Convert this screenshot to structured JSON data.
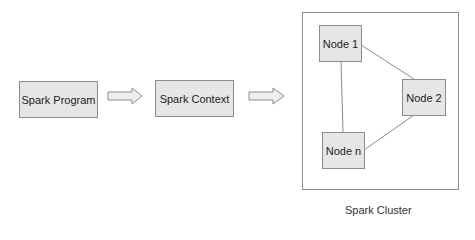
{
  "diagram": {
    "flow": [
      {
        "id": "program",
        "label": "Spark Program"
      },
      {
        "id": "context",
        "label": "Spark Context"
      }
    ],
    "arrows": [
      {
        "from": "program",
        "to": "context",
        "icon": "hollow-right-arrow"
      },
      {
        "from": "context",
        "to": "cluster",
        "icon": "hollow-right-arrow"
      }
    ],
    "cluster": {
      "label": "Spark Cluster",
      "nodes": [
        {
          "id": "node1",
          "label": "Node 1"
        },
        {
          "id": "node2",
          "label": "Node 2"
        },
        {
          "id": "noden",
          "label": "Node n"
        }
      ],
      "edges": [
        [
          "node1",
          "node2"
        ],
        [
          "node1",
          "noden"
        ],
        [
          "node2",
          "noden"
        ]
      ]
    },
    "colors": {
      "box_fill": "#e6e6e6",
      "border": "#8c8c8c",
      "background": "#ffffff"
    }
  }
}
